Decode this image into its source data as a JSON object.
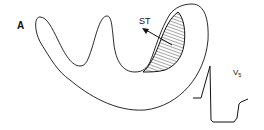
{
  "figure": {
    "panel_label": "A",
    "annotations": {
      "st_vector": "ST",
      "lead_label": "V",
      "lead_subscript": "5"
    },
    "colors": {
      "stroke": "#111111",
      "background": "#ffffff",
      "hatch": "#222222"
    },
    "elements": [
      "heart cross-section outline",
      "hatched injury region",
      "ST vector arrow",
      "ECG tracing with ST depression"
    ]
  }
}
